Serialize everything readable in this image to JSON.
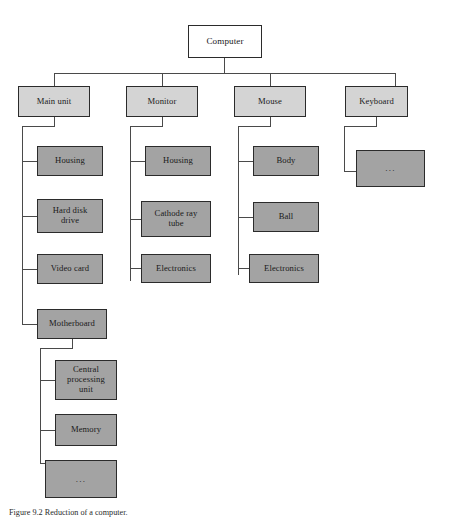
{
  "figure": {
    "caption": "Figure 9.2 Reduction of a computer.",
    "colors": {
      "page_background": "#ffffff",
      "root_fill": "#ffffff",
      "level2_fill": "#d4d4d4",
      "level3_fill": "#a3a3a3",
      "border": "#2b2b2b",
      "connector": "#4a4a4a",
      "text": "#1a1a1a"
    },
    "root": {
      "label": "Computer"
    },
    "level2": [
      {
        "label": "Main unit"
      },
      {
        "label": "Monitor"
      },
      {
        "label": "Mouse"
      },
      {
        "label": "Keyboard"
      }
    ],
    "main_unit_children": [
      {
        "label": "Housing"
      },
      {
        "label": "Hard disk\ndrive"
      },
      {
        "label": "Video card"
      },
      {
        "label": "Motherboard"
      }
    ],
    "monitor_children": [
      {
        "label": "Housing"
      },
      {
        "label": "Cathode ray\ntube"
      },
      {
        "label": "Electronics"
      }
    ],
    "mouse_children": [
      {
        "label": "Body"
      },
      {
        "label": "Ball"
      },
      {
        "label": "Electronics"
      }
    ],
    "keyboard_children": [
      {
        "label": "..."
      }
    ],
    "motherboard_children": [
      {
        "label": "Central\nprocessing\nunit"
      },
      {
        "label": "Memory"
      },
      {
        "label": "..."
      }
    ]
  }
}
